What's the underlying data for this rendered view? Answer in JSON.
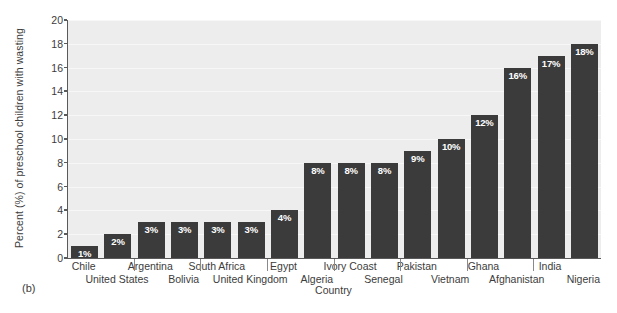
{
  "figure": {
    "panel_label": "(b)",
    "background_color": "#ffffff",
    "plot_background_color": "#ededed",
    "bar_color": "#3b3b3b",
    "axis_color": "#5a5a5a",
    "value_label_color": "#ffffff"
  },
  "chart_data": {
    "type": "bar",
    "title": "",
    "xlabel": "Country",
    "ylabel": "Percent (%) of preschool children with wasting",
    "categories": [
      "Chile",
      "United States",
      "Argentina",
      "Bolivia",
      "South Africa",
      "United Kingdom",
      "Egypt",
      "Algeria",
      "Ivory Coast",
      "Senegal",
      "Pakistan",
      "Vietnam",
      "Ghana",
      "Afghanistan",
      "India",
      "Nigeria"
    ],
    "values": [
      1,
      2,
      3,
      3,
      3,
      3,
      4,
      8,
      8,
      8,
      9,
      10,
      12,
      16,
      17,
      18
    ],
    "value_labels": [
      "1%",
      "2%",
      "3%",
      "3%",
      "3%",
      "3%",
      "4%",
      "8%",
      "8%",
      "8%",
      "9%",
      "10%",
      "12%",
      "16%",
      "17%",
      "18%"
    ],
    "ylim": [
      0,
      20
    ],
    "ytick_values": [
      0,
      2,
      4,
      6,
      8,
      10,
      12,
      14,
      16,
      18,
      20
    ],
    "ytick_labels": [
      "0",
      "2",
      "4",
      "6",
      "8",
      "10",
      "12",
      "14",
      "16",
      "18",
      "20"
    ],
    "grid": true,
    "legend": false,
    "label_rows": {
      "top": [
        "Chile",
        "Argentina",
        "South Africa",
        "Egypt",
        "Ivory Coast",
        "Pakistan",
        "Ghana",
        "India"
      ],
      "bottom": [
        "United States",
        "Bolivia",
        "United Kingdom",
        "Algeria",
        "Senegal",
        "Vietnam",
        "Afghanistan",
        "Nigeria"
      ]
    }
  }
}
